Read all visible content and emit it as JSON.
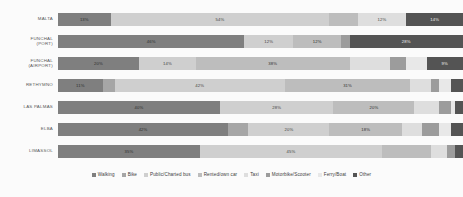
{
  "chart_data": {
    "type": "bar",
    "subtype": "stacked-bar-horizontal-100pct",
    "title": "",
    "xlabel": "",
    "ylabel": "",
    "orientation": "horizontal",
    "stacked": true,
    "normalized_to_percent": true,
    "xlim": [
      0,
      100
    ],
    "grid": false,
    "legend_position": "bottom",
    "categories": [
      "MALTA",
      "FUNCHAL\n(PORT)",
      "FUNCHAL\n(AIRPORT)",
      "RETHYMNO",
      "LAS PALMAS",
      "ELBA",
      "LIMASSOL"
    ],
    "series": [
      {
        "name": "Walking",
        "color": "#7f7f7f",
        "values": [
          13,
          46,
          20,
          11,
          40,
          42,
          35
        ],
        "labels": [
          "13%",
          "46%",
          "20%",
          "11%",
          "40%",
          "42%",
          "35%"
        ]
      },
      {
        "name": "Bike",
        "color": "#a6a6a6",
        "values": [
          0,
          0,
          0,
          3,
          0,
          5,
          0
        ],
        "labels": [
          "",
          "",
          "",
          "",
          "",
          "",
          ""
        ]
      },
      {
        "name": "Public/Charted bus",
        "color": "#cfcfcf",
        "values": [
          54,
          12,
          14,
          42,
          28,
          20,
          45
        ],
        "labels": [
          "54%",
          "12%",
          "14%",
          "42%",
          "28%",
          "20%",
          "45%"
        ]
      },
      {
        "name": "Rented/own car",
        "color": "#bdbdbd",
        "values": [
          7,
          12,
          38,
          31,
          20,
          18,
          12
        ],
        "labels": [
          "",
          "12%",
          "38%",
          "31%",
          "20%",
          "18%",
          ""
        ]
      },
      {
        "name": "Taxi",
        "color": "#dedede",
        "values": [
          12,
          0,
          10,
          5,
          6,
          5,
          4
        ],
        "labels": [
          "12%",
          "",
          "",
          "",
          "",
          "",
          ""
        ]
      },
      {
        "name": "Motorbike/Scooter",
        "color": "#9c9c9c",
        "values": [
          0,
          2,
          4,
          2,
          3,
          4,
          2
        ],
        "labels": [
          "",
          "",
          "",
          "",
          "",
          "",
          ""
        ]
      },
      {
        "name": "Ferry/Boat",
        "color": "#e8e8e8",
        "values": [
          0,
          0,
          5,
          3,
          1,
          3,
          0
        ],
        "labels": [
          "",
          "",
          "",
          "",
          "",
          "",
          ""
        ]
      },
      {
        "name": "Other",
        "color": "#545454",
        "values": [
          14,
          28,
          9,
          3,
          2,
          3,
          2
        ],
        "labels": [
          "14%",
          "28%",
          "9%",
          "",
          "",
          "",
          ""
        ]
      }
    ]
  },
  "legend": {
    "items": [
      {
        "label": "Walking",
        "color": "#7f7f7f"
      },
      {
        "label": "Bike",
        "color": "#a6a6a6"
      },
      {
        "label": "Public/Charted bus",
        "color": "#cfcfcf"
      },
      {
        "label": "Rented/own car",
        "color": "#bdbdbd"
      },
      {
        "label": "Taxi",
        "color": "#dedede"
      },
      {
        "label": "Motorbike/Scooter",
        "color": "#9c9c9c"
      },
      {
        "label": "Ferry/Boat",
        "color": "#e8e8e8"
      },
      {
        "label": "Other",
        "color": "#545454"
      }
    ]
  }
}
